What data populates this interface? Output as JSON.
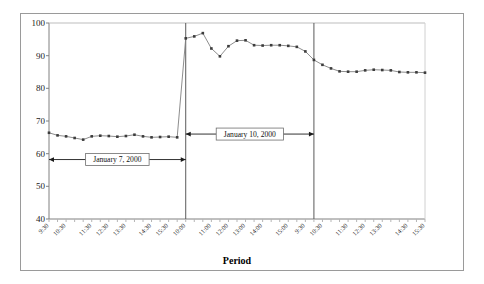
{
  "figure": {
    "border_color": "#9a9a9a",
    "background": "#ffffff"
  },
  "chart_data": {
    "type": "line",
    "title": "",
    "subtitle": "",
    "xlabel": "Period",
    "ylabel": "",
    "ylim": [
      40,
      100
    ],
    "ytick_values": [
      40,
      50,
      60,
      70,
      80,
      90,
      100
    ],
    "ytick_labels": [
      "40",
      "50",
      "60",
      "70",
      "80",
      "90",
      "100"
    ],
    "grid": false,
    "legend": "none",
    "line_color": "#808080",
    "marker_color": "#3c3c3c",
    "marker_shape": "square",
    "xtick_labels": [
      "9:30",
      "10:30",
      "11:30",
      "12:30",
      "13:30",
      "14:30",
      "15:30",
      "10:00",
      "11:00",
      "12:00",
      "13:00",
      "14:00",
      "15:00",
      "9:30",
      "10:30",
      "11:30",
      "12:30",
      "13:30",
      "14:30",
      "15:30"
    ],
    "x": [
      0,
      1,
      2,
      3,
      4,
      5,
      6,
      7,
      8,
      9,
      10,
      11,
      12,
      13,
      14,
      15,
      16,
      17,
      18,
      19,
      20,
      21,
      22,
      23,
      24,
      25,
      26,
      27,
      28,
      29,
      30,
      31,
      32,
      33,
      34,
      35,
      36,
      37,
      38,
      39,
      40,
      41,
      42,
      43,
      44
    ],
    "values": [
      66.4,
      65.6,
      65.3,
      64.8,
      64.3,
      65.3,
      65.5,
      65.4,
      65.2,
      65.4,
      65.8,
      65.3,
      65.0,
      65.1,
      65.2,
      65.0,
      95.3,
      95.9,
      96.9,
      92.2,
      89.8,
      92.9,
      94.6,
      94.7,
      93.2,
      93.1,
      93.2,
      93.2,
      93.0,
      92.7,
      91.3,
      88.7,
      87.2,
      86.1,
      85.2,
      85.1,
      85.1,
      85.5,
      85.7,
      85.6,
      85.5,
      85.0,
      84.9,
      84.9,
      84.8
    ],
    "segment_breaks": [
      16,
      31
    ],
    "annotations": [
      {
        "name": "january-7-annotation",
        "text": "January 7, 2000",
        "y_value": 58.2,
        "x_start": 0,
        "x_end": 16
      },
      {
        "name": "january-10-annotation",
        "text": "January 10, 2000",
        "y_value": 66.0,
        "x_start": 16,
        "x_end": 31
      }
    ],
    "divider_x": [
      16,
      31
    ]
  }
}
